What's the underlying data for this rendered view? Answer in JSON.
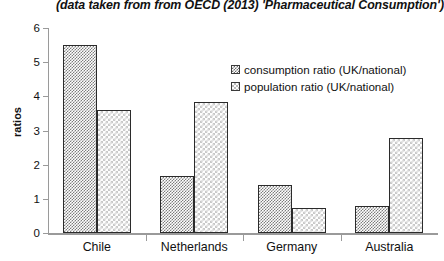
{
  "chart_data": {
    "type": "bar",
    "title": "(data taken from from OECD (2013) 'Pharmaceutical Consumption')",
    "xlabel": "",
    "ylabel": "ratios",
    "ylim": [
      0,
      6
    ],
    "yticks": [
      "0",
      "1",
      "2",
      "3",
      "4",
      "5",
      "6"
    ],
    "grid": false,
    "legend_position": "upper right",
    "categories": [
      "Chile",
      "Netherlands",
      "Germany",
      "Australia"
    ],
    "series": [
      {
        "name": "consumption ratio (UK/national)",
        "values": [
          5.5,
          1.67,
          1.4,
          0.78
        ]
      },
      {
        "name": "population ratio (UK/national)",
        "values": [
          3.6,
          3.83,
          0.73,
          2.77
        ]
      }
    ]
  }
}
